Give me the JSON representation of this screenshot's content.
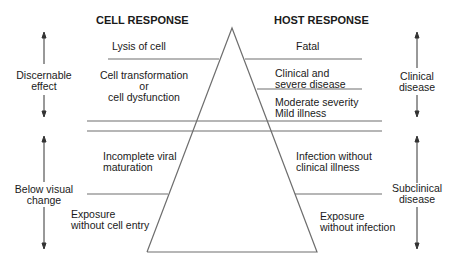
{
  "headers": {
    "cell": "CELL RESPONSE",
    "host": "HOST RESPONSE"
  },
  "cell_response": {
    "lysis": "Lysis of cell",
    "transformation": [
      "Cell transformation",
      "or",
      "cell dysfunction"
    ],
    "incomplete": [
      "Incomplete viral",
      "maturation"
    ],
    "exposure": [
      "Exposure",
      "without cell entry"
    ]
  },
  "host_response": {
    "fatal": "Fatal",
    "clinical_severe": [
      "Clinical and",
      "severe disease"
    ],
    "moderate": [
      "Moderate severity",
      "Mild illness"
    ],
    "infection": [
      "Infection without",
      "clinical illness"
    ],
    "exposure": [
      "Exposure",
      "without infection"
    ]
  },
  "left_axis": {
    "upper": [
      "Discernable",
      "effect"
    ],
    "lower": [
      "Below visual",
      "change"
    ]
  },
  "right_axis": {
    "upper": [
      "Clinical",
      "disease"
    ],
    "lower": [
      "Subclinical",
      "disease"
    ]
  },
  "colors": {
    "line": "#6e6e6e",
    "text": "#1a1a1a"
  }
}
